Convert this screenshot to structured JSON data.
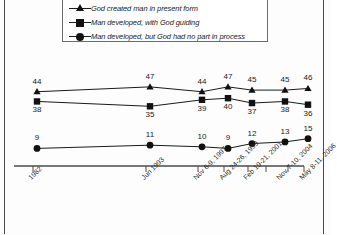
{
  "chart_data": {
    "type": "line",
    "title": "",
    "subtitle": "",
    "xlabel": "",
    "ylabel": "",
    "ylim": [
      0,
      55
    ],
    "grid": false,
    "legend_position": "top",
    "categories": [
      "1982",
      "Jun 1993",
      "Nov 6-9, 1997",
      "Aug 24-26, 1999",
      "Feb 19-21, 2001",
      "Nov 7-10, 2004",
      "May 8-11, 2006"
    ],
    "x": [
      "1982",
      "Jun 1993",
      "Nov 6-9, 1997",
      "Aug 24-26, 1999",
      "Feb 19-21, 2001",
      "Nov 7-10, 2004",
      "May 8-11, 2006"
    ],
    "tick_labels": [
      "1982",
      "Jun 1993",
      "Nov 6-9, 1997",
      "Aug 24-26, 1999",
      "Feb 19-21, 2001",
      "Nov 7-10, 2004",
      "May 8-11, 2006"
    ],
    "series": [
      {
        "name": "God created man in present form",
        "marker": "triangle",
        "values": [
          44,
          47,
          44,
          47,
          45,
          45,
          46
        ],
        "labels": [
          "44",
          "47",
          "44",
          "47",
          "45",
          "45",
          "46"
        ],
        "label_position": "above"
      },
      {
        "name": "Man developed, with God guiding",
        "marker": "square",
        "values": [
          38,
          35,
          39,
          40,
          37,
          38,
          36
        ],
        "labels": [
          "38",
          "35",
          "39",
          "40",
          "37",
          "38",
          "36"
        ],
        "label_position": "below"
      },
      {
        "name": "Man developed, but God had no part in process",
        "marker": "circle",
        "values": [
          9,
          11,
          10,
          9,
          12,
          13,
          15
        ],
        "labels": [
          "9",
          "11",
          "10",
          "9",
          "12",
          "13",
          "15"
        ],
        "label_position": "above"
      }
    ],
    "colors": {
      "line": "#1a1a1a",
      "marker": "#111111",
      "axis": "#4a4a4a",
      "text": "#1a1a1a",
      "background": "#fdfdfd"
    }
  },
  "legend": {
    "items": [
      {
        "marker": "triangle-marker",
        "label": "God created man in present form"
      },
      {
        "marker": "square-marker",
        "label": "Man developed, with God guiding"
      },
      {
        "marker": "circle-marker",
        "label": "Man developed, but God had no part in process"
      }
    ]
  }
}
